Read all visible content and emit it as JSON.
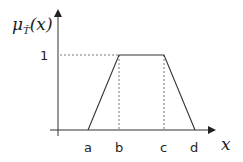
{
  "diagram": {
    "y_axis_label": "μ_T̃(x)",
    "y_axis_label_main": "μ",
    "y_axis_label_sub": "T̃",
    "y_axis_label_arg": "(x)",
    "x_axis_label": "x",
    "y_tick": "1",
    "x_ticks": [
      "a",
      "b",
      "c",
      "d"
    ],
    "colors": {
      "line": "#333333",
      "dash": "#555555",
      "text": "#222222"
    }
  }
}
